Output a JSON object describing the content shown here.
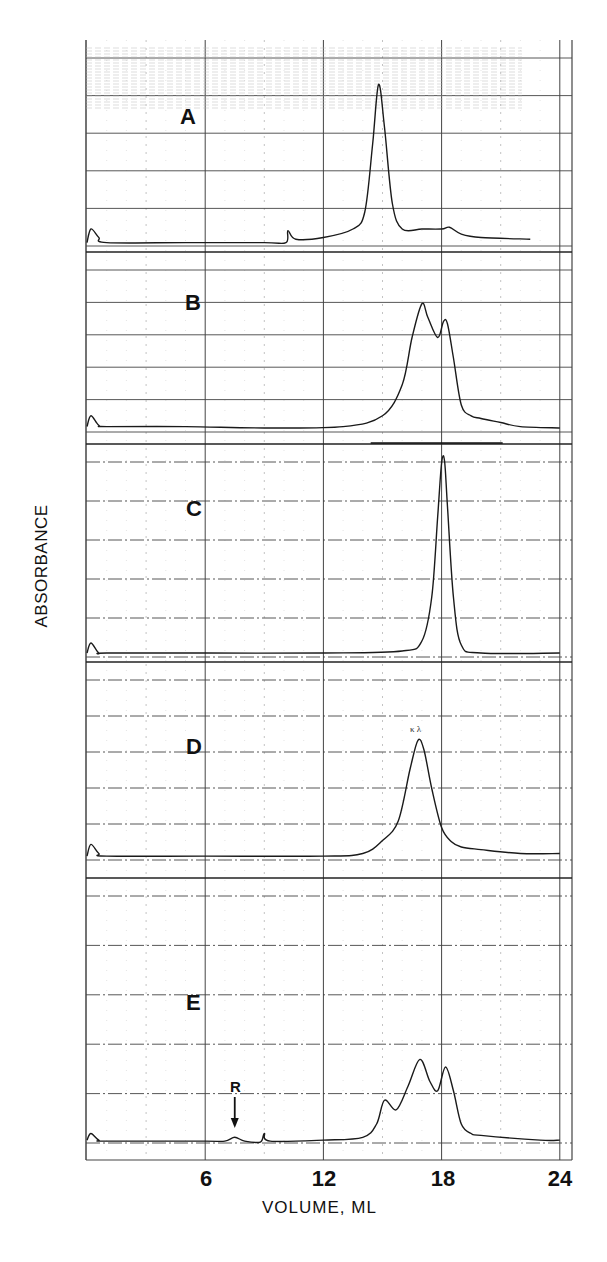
{
  "figure": {
    "y_title": "ABSORBANCE",
    "x_title": "VOLUME, ML",
    "x_ticks": [
      "6",
      "12",
      "18",
      "24"
    ],
    "panels": [
      {
        "label": "A"
      },
      {
        "label": "B"
      },
      {
        "label": "C"
      },
      {
        "label": "D",
        "peak_note": "κ λ"
      },
      {
        "label": "E",
        "marker": "R"
      }
    ],
    "colors": {
      "trace": "#1a1a1a",
      "grid_major": "#444444",
      "grid_minor": "#9a9a9a",
      "background": "#ffffff"
    }
  },
  "chart_data": {
    "type": "line",
    "title": "",
    "xlabel": "VOLUME, ML",
    "ylabel": "ABSORBANCE",
    "xlim": [
      0,
      24.5
    ],
    "x_ticks": [
      6,
      12,
      18,
      24
    ],
    "grid": true,
    "legend": "none",
    "chart_recorder_scale_labels": [
      0,
      40,
      50,
      60,
      70,
      80,
      90,
      100
    ],
    "series": [
      {
        "name": "A",
        "x": [
          0.0,
          0.2,
          0.6,
          1.0,
          5.0,
          9.0,
          10.1,
          10.2,
          10.6,
          12.0,
          13.5,
          14.1,
          14.5,
          14.8,
          15.1,
          15.5,
          16.0,
          17.0,
          18.0,
          18.4,
          19.0,
          20.0,
          22.5
        ],
        "relative_absorbance": [
          0.02,
          0.1,
          0.05,
          0.02,
          0.02,
          0.02,
          0.02,
          0.09,
          0.04,
          0.05,
          0.1,
          0.2,
          0.6,
          0.95,
          0.7,
          0.25,
          0.1,
          0.1,
          0.1,
          0.11,
          0.07,
          0.05,
          0.04
        ],
        "peaks": [
          {
            "volume": 14.8,
            "note": "major peak"
          },
          {
            "volume": 18.3,
            "note": "minor shoulder"
          }
        ]
      },
      {
        "name": "B",
        "x": [
          0.0,
          0.2,
          0.6,
          1.0,
          5.0,
          9.0,
          13.0,
          15.0,
          16.0,
          16.5,
          17.0,
          17.3,
          17.8,
          18.1,
          18.3,
          18.6,
          19.0,
          19.5,
          20.0,
          21.0,
          22.0,
          24.0
        ],
        "relative_absorbance": [
          0.04,
          0.12,
          0.05,
          0.04,
          0.04,
          0.03,
          0.04,
          0.12,
          0.35,
          0.7,
          0.95,
          0.85,
          0.7,
          0.82,
          0.8,
          0.55,
          0.2,
          0.12,
          0.1,
          0.07,
          0.04,
          0.03
        ],
        "peaks": [
          {
            "volume": 17.0,
            "note": "major"
          },
          {
            "volume": 18.1,
            "note": "second"
          }
        ]
      },
      {
        "name": "C",
        "x": [
          0.0,
          0.2,
          0.6,
          1.0,
          6.0,
          12.0,
          16.0,
          17.0,
          17.5,
          17.8,
          18.0,
          18.15,
          18.3,
          18.6,
          19.0,
          20.0,
          24.0
        ],
        "relative_absorbance": [
          0.02,
          0.07,
          0.02,
          0.02,
          0.02,
          0.02,
          0.03,
          0.08,
          0.3,
          0.7,
          0.97,
          0.98,
          0.75,
          0.3,
          0.06,
          0.02,
          0.02
        ],
        "peaks": [
          {
            "volume": 18.1,
            "note": "single sharp peak"
          }
        ]
      },
      {
        "name": "D",
        "x": [
          0.0,
          0.2,
          0.6,
          1.0,
          6.0,
          12.0,
          14.0,
          15.0,
          15.8,
          16.4,
          16.8,
          17.1,
          17.5,
          18.0,
          18.5,
          19.0,
          20.0,
          22.0,
          24.0
        ],
        "relative_absorbance": [
          0.03,
          0.12,
          0.05,
          0.03,
          0.03,
          0.03,
          0.05,
          0.15,
          0.3,
          0.7,
          0.92,
          0.85,
          0.55,
          0.25,
          0.14,
          0.1,
          0.08,
          0.05,
          0.05
        ],
        "peaks": [
          {
            "volume": 16.9,
            "note": "κ λ"
          }
        ]
      },
      {
        "name": "E",
        "x": [
          0.0,
          0.2,
          0.6,
          1.0,
          6.0,
          7.0,
          7.5,
          8.0,
          8.8,
          9.0,
          9.3,
          12.0,
          14.0,
          14.7,
          15.1,
          15.7,
          16.3,
          16.9,
          17.4,
          17.8,
          18.2,
          18.6,
          19.0,
          19.5,
          20.0,
          23.0,
          24.0
        ],
        "relative_absorbance": [
          0.03,
          0.1,
          0.03,
          0.02,
          0.02,
          0.02,
          0.06,
          0.02,
          0.01,
          0.1,
          0.02,
          0.03,
          0.06,
          0.2,
          0.45,
          0.35,
          0.6,
          0.88,
          0.65,
          0.55,
          0.8,
          0.55,
          0.2,
          0.1,
          0.08,
          0.03,
          0.03
        ],
        "peaks": [
          {
            "volume": 7.5,
            "note": "R"
          },
          {
            "volume": 15.1
          },
          {
            "volume": 16.9
          },
          {
            "volume": 18.2
          }
        ]
      }
    ]
  }
}
